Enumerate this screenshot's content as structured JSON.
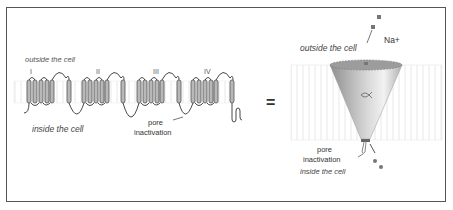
{
  "left_panel": {
    "outside_label": "outside the cell",
    "inside_label": "inside the cell",
    "domains": [
      "I",
      "II",
      "III",
      "IV"
    ],
    "pore_label_line1": "pore",
    "pore_label_line2": "inactivation"
  },
  "equals": "=",
  "right_panel": {
    "outside_label": "outside the cell",
    "inside_label": "inside the cell",
    "ion_label": "Na+",
    "pore_label_line1": "pore",
    "pore_label_line2": "inactivation"
  },
  "colors": {
    "frame": "#555555",
    "helix_fill": "#b8b8b8",
    "helix_stroke": "#555555",
    "membrane_line": "#e4e4e4",
    "pore_dark": "#9a9a9a",
    "pore_light": "#e8e8e8",
    "ion": "#777777"
  }
}
